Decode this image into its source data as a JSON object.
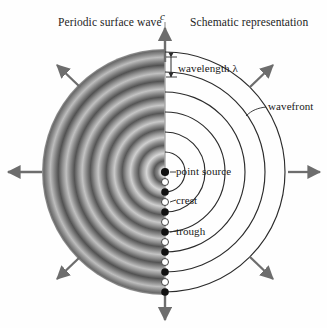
{
  "figure": {
    "titles": {
      "left": "Periodic surface wave",
      "right": "Schematic representation"
    },
    "vector_label": "c",
    "labels": {
      "wavelength": "wavelength λ",
      "wavefront": "wavefront",
      "point_source": "point source",
      "crest": "crest",
      "trough": "trough"
    },
    "geometry": {
      "center_x": 165,
      "center_y": 172,
      "disk_radius": 123,
      "ring_period_px": 20,
      "dot_spacing_px": 10,
      "arc_count": 6,
      "arrow_count": 8
    },
    "colors": {
      "background": "#fefefe",
      "ink": "#1a1a1a",
      "arc_stroke": "#2b2b2b",
      "arrow": "#6d6d6d",
      "axis": "#8f8f8f",
      "ring_dark": "#5d5d5d",
      "ring_light": "#c9c9c9",
      "crest_dot": "#111111",
      "trough_dot": "#ffffff"
    },
    "dots": [
      {
        "index": 0,
        "type": "point-source",
        "fill": "crest"
      },
      {
        "index": 1,
        "type": "trough",
        "fill": "trough"
      },
      {
        "index": 2,
        "type": "crest",
        "fill": "crest"
      },
      {
        "index": 3,
        "type": "trough",
        "fill": "trough"
      },
      {
        "index": 4,
        "type": "crest",
        "fill": "crest"
      },
      {
        "index": 5,
        "type": "trough",
        "fill": "trough"
      },
      {
        "index": 6,
        "type": "crest",
        "fill": "crest"
      },
      {
        "index": 7,
        "type": "trough",
        "fill": "trough"
      },
      {
        "index": 8,
        "type": "crest",
        "fill": "crest"
      },
      {
        "index": 9,
        "type": "trough",
        "fill": "trough"
      },
      {
        "index": 10,
        "type": "crest",
        "fill": "crest"
      },
      {
        "index": 11,
        "type": "trough",
        "fill": "trough"
      },
      {
        "index": 12,
        "type": "crest",
        "fill": "crest"
      }
    ]
  }
}
